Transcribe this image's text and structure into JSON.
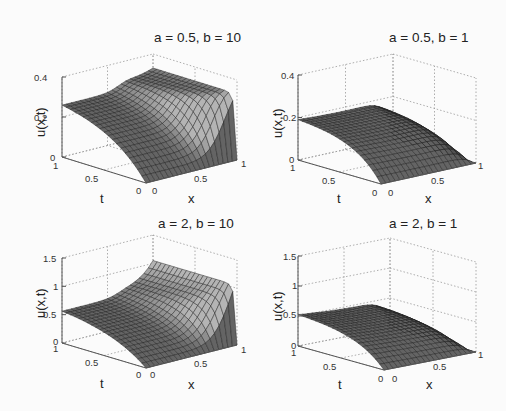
{
  "figure": {
    "layout": "2x2 grid of 3D surface plots",
    "background": "#fbfbfb",
    "surface_color": "#6a6a6a",
    "edge_color": "#1e1e1e"
  },
  "chart_data": [
    {
      "type": "surface",
      "title": "a = 0.5, b = 10",
      "xlabel": "x",
      "ylabel": "t",
      "zlabel": "u(x,t)",
      "xticks": [
        "0",
        "0.5",
        "1"
      ],
      "yticks": [
        "0",
        "0.5",
        "1"
      ],
      "zticks": [
        "0",
        "0.2",
        "0.4"
      ],
      "zlim": [
        0,
        0.4
      ],
      "params": {
        "a": 0.5,
        "b": 10
      },
      "u_at_x0_t1": 0.3,
      "u_at_x1_t1": 0.33,
      "u_at_t0": 0,
      "peak_near_x1_early_t": 0.33,
      "grid": true
    },
    {
      "type": "surface",
      "title": "a = 0.5, b = 1",
      "xlabel": "x",
      "ylabel": "t",
      "zlabel": "u(x,t)",
      "xticks": [
        "0",
        "0.5",
        "1"
      ],
      "yticks": [
        "0",
        "0.5",
        "1"
      ],
      "zticks": [
        "0",
        "0.2",
        "0.4"
      ],
      "zlim": [
        0,
        0.4
      ],
      "params": {
        "a": 0.5,
        "b": 1
      },
      "u_at_x0_t1": 0.2,
      "u_at_x1_t1": 0.2,
      "u_at_t0": 0,
      "grid": true
    },
    {
      "type": "surface",
      "title": "a = 2, b = 10",
      "xlabel": "x",
      "ylabel": "t",
      "zlabel": "u(x,t)",
      "xticks": [
        "0",
        "0.5",
        "1"
      ],
      "yticks": [
        "0",
        "0.5",
        "1"
      ],
      "zticks": [
        "0",
        "0.5",
        "1",
        "1.5"
      ],
      "zlim": [
        0,
        1.5
      ],
      "params": {
        "a": 2,
        "b": 10
      },
      "u_at_x0_t1": 0.65,
      "u_at_x1_t1": 1.05,
      "u_at_t0": 0,
      "grid": true
    },
    {
      "type": "surface",
      "title": "a = 2, b = 1",
      "xlabel": "x",
      "ylabel": "t",
      "zlabel": "u(x,t)",
      "xticks": [
        "0",
        "0.5",
        "1"
      ],
      "yticks": [
        "0",
        "0.5",
        "1"
      ],
      "zticks": [
        "0",
        "0.5",
        "1",
        "1.5"
      ],
      "zlim": [
        0,
        1.5
      ],
      "params": {
        "a": 2,
        "b": 1
      },
      "u_at_x0_t1": 0.55,
      "u_at_x1_t1": 0.5,
      "u_at_t0": 0,
      "grid": true
    }
  ],
  "panels": [
    {
      "title": "a = 0.5, b = 10",
      "zlabel": "u(x,t)",
      "xlabel": "x",
      "tlabel": "t",
      "z_ticks": [
        "0.4",
        "0.2",
        "0"
      ],
      "t_ticks": [
        "1",
        "0.5",
        "0"
      ],
      "x_ticks": [
        "0",
        "0.5",
        "1"
      ]
    },
    {
      "title": "a = 0.5, b = 1",
      "zlabel": "u(x,t)",
      "xlabel": "x",
      "tlabel": "t",
      "z_ticks": [
        "0.4",
        "0.2",
        "0"
      ],
      "t_ticks": [
        "1",
        "0.5",
        "0"
      ],
      "x_ticks": [
        "0",
        "0.5",
        "1"
      ]
    },
    {
      "title": "a = 2, b = 10",
      "zlabel": "u(x,t)",
      "xlabel": "x",
      "tlabel": "t",
      "z_ticks": [
        "1.5",
        "1",
        "0.5",
        "0"
      ],
      "t_ticks": [
        "1",
        "0.5",
        "0"
      ],
      "x_ticks": [
        "0",
        "0.5",
        "1"
      ]
    },
    {
      "title": "a = 2, b = 1",
      "zlabel": "u(x,t)",
      "xlabel": "x",
      "tlabel": "t",
      "z_ticks": [
        "1.5",
        "1",
        "0.5",
        "0"
      ],
      "t_ticks": [
        "1",
        "0.5",
        "0"
      ],
      "x_ticks": [
        "0",
        "0.5",
        "1"
      ]
    }
  ]
}
